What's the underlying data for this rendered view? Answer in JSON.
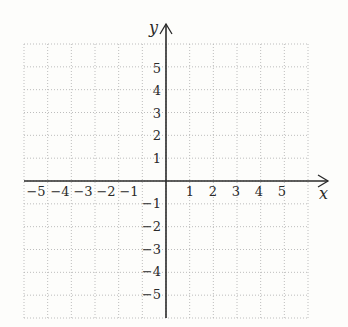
{
  "diagram": {
    "type": "coordinate-plane",
    "background_color": "#fdfdfb",
    "grid_color": "#b5b5b5",
    "axis_color": "#2a2a2a",
    "x_axis": {
      "label": "x",
      "range": [
        -6,
        6
      ],
      "tick_labels": [
        "-5",
        "-4",
        "-3",
        "-2",
        "-1",
        "1",
        "2",
        "3",
        "4",
        "5"
      ]
    },
    "y_axis": {
      "label": "y",
      "range": [
        -6,
        6
      ],
      "tick_labels": [
        "5",
        "4",
        "3",
        "2",
        "1",
        "-1",
        "-2",
        "-3",
        "-4",
        "-5"
      ]
    },
    "grid": {
      "style": "dotted",
      "columns": 12,
      "rows": 12
    }
  }
}
